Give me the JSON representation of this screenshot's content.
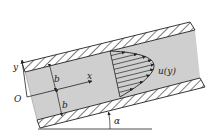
{
  "diagram": {
    "labels": {
      "y_axis": "y",
      "x_axis": "x",
      "origin": "O",
      "half_width_top": "b",
      "half_width_bottom": "b",
      "velocity_profile": "u(y)",
      "angle": "α"
    },
    "profile": {
      "shape": "parabolic",
      "arrow_count": 9
    },
    "colors": {
      "fluid": "#cfcfcf",
      "line": "#222222",
      "background": "#ffffff"
    }
  }
}
